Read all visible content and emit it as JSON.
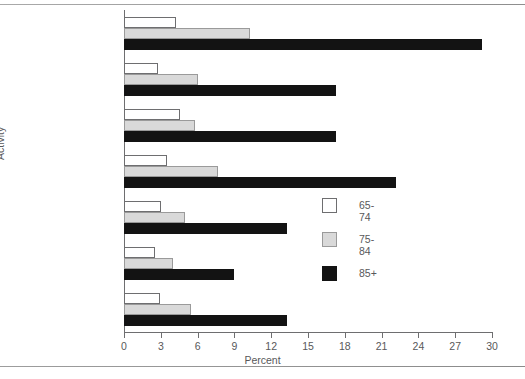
{
  "chart_data": {
    "type": "bar",
    "orientation": "horizontal",
    "title": "",
    "xlabel": "Percent",
    "ylabel": "Activity",
    "xlim": [
      0,
      30
    ],
    "xticks": [
      0,
      3,
      6,
      9,
      12,
      15,
      18,
      21,
      24,
      27,
      30
    ],
    "grid": false,
    "legend_position": "center-right",
    "categories": [
      "Shopping",
      "Light housework",
      "Preparing meals",
      "Bathing",
      "Dressing",
      "Getting in and out\nof bed or chair",
      "Getting outside\nand walking"
    ],
    "series": [
      {
        "name": "65-74",
        "color": "#ffffff",
        "values": [
          4.2,
          2.8,
          4.6,
          3.5,
          3.0,
          2.5,
          2.9
        ]
      },
      {
        "name": "75-84",
        "color": "#d9d9d9",
        "values": [
          10.3,
          6.0,
          5.8,
          7.7,
          5.0,
          4.0,
          5.5
        ]
      },
      {
        "name": "85+",
        "color": "#131313",
        "values": [
          29.2,
          17.3,
          17.3,
          22.2,
          13.3,
          9.0,
          13.3
        ]
      }
    ]
  },
  "legend": {
    "items": [
      {
        "label": "65-74"
      },
      {
        "label": "75-84"
      },
      {
        "label": "85+"
      }
    ]
  }
}
